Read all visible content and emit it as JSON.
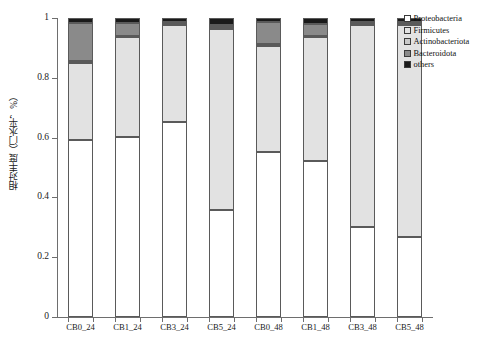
{
  "chart_data": {
    "type": "bar",
    "stacked": true,
    "normalized": true,
    "title": "",
    "xlabel": "",
    "ylabel": "相对丰度（门水平，%）",
    "ylim": [
      0,
      1
    ],
    "ytick_labels": [
      "0",
      "0.2",
      "0.4",
      "0.6",
      "0.8",
      "1"
    ],
    "ytick_values": [
      0,
      0.2,
      0.4,
      0.6,
      0.8,
      1
    ],
    "grid": false,
    "legend_position": "top-right",
    "categories": [
      "CB0_24",
      "CB1_24",
      "CB3_24",
      "CB5_24",
      "CB0_48",
      "CB1_48",
      "CB3_48",
      "CB5_48"
    ],
    "series": [
      {
        "name": "Proteobacteria",
        "color": "#ffffff",
        "values": [
          0.592,
          0.602,
          0.652,
          0.358,
          0.551,
          0.521,
          0.302,
          0.268
        ]
      },
      {
        "name": "Firmicutes",
        "color": "#e2e2e2",
        "values": [
          0.258,
          0.333,
          0.325,
          0.606,
          0.356,
          0.415,
          0.675,
          0.707
        ]
      },
      {
        "name": "Actinobacteriota",
        "color": "#c9c9c9",
        "values": [
          0.005,
          0.005,
          0.005,
          0.005,
          0.005,
          0.005,
          0.005,
          0.005
        ]
      },
      {
        "name": "Bacteroidota",
        "color": "#8a8a8a",
        "values": [
          0.128,
          0.043,
          0.004,
          0.008,
          0.074,
          0.04,
          0.003,
          0.005
        ]
      },
      {
        "name": "others",
        "color": "#1a1a1a",
        "values": [
          0.017,
          0.017,
          0.014,
          0.023,
          0.014,
          0.019,
          0.015,
          0.015
        ]
      }
    ]
  },
  "legend": {
    "items": [
      {
        "label": "Proteobacteria",
        "color": "#ffffff"
      },
      {
        "label": "Firmicutes",
        "color": "#e2e2e2"
      },
      {
        "label": "Actinobacteriota",
        "color": "#c9c9c9"
      },
      {
        "label": "Bacteroidota",
        "color": "#8a8a8a"
      },
      {
        "label": "others",
        "color": "#1a1a1a"
      }
    ]
  },
  "bottom_caption": {
    "parts": [
      "",
      "",
      ""
    ]
  }
}
